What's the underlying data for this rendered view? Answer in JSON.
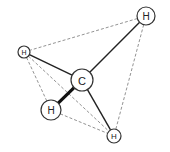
{
  "diagram": {
    "type": "molecule-tetrahedral",
    "atoms": [
      {
        "id": "C",
        "label": "C",
        "x": 82,
        "y": 80,
        "r": 11,
        "font": 11
      },
      {
        "id": "H1",
        "label": "H",
        "x": 146,
        "y": 16,
        "r": 9,
        "font": 10
      },
      {
        "id": "H2",
        "label": "H",
        "x": 24,
        "y": 52,
        "r": 6,
        "font": 7
      },
      {
        "id": "H3",
        "label": "H",
        "x": 51,
        "y": 110,
        "r": 10,
        "font": 10
      },
      {
        "id": "H4",
        "label": "H",
        "x": 114,
        "y": 136,
        "r": 7,
        "font": 8
      }
    ],
    "bonds": [
      {
        "from": "C",
        "to": "H1",
        "style": "solid"
      },
      {
        "from": "C",
        "to": "H2",
        "style": "solid"
      },
      {
        "from": "C",
        "to": "H3",
        "style": "wedge"
      },
      {
        "from": "C",
        "to": "H4",
        "style": "solid"
      }
    ],
    "tetrahedron_edges": [
      {
        "from": "H1",
        "to": "H2"
      },
      {
        "from": "H1",
        "to": "H4"
      },
      {
        "from": "H2",
        "to": "H3"
      },
      {
        "from": "H2",
        "to": "H4"
      },
      {
        "from": "H3",
        "to": "H4"
      }
    ]
  }
}
